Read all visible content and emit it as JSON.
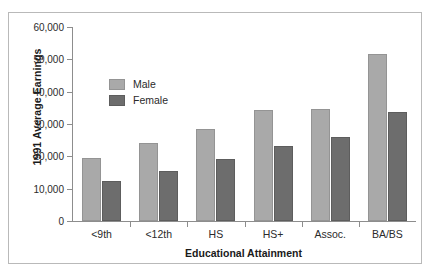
{
  "chart_data": {
    "type": "bar",
    "title": "",
    "xlabel": "Educational Attainment",
    "ylabel": "1991 Average Earnings",
    "categories": [
      "<9th",
      "<12th",
      "HS",
      "HS+",
      "Assoc.",
      "BA/BS"
    ],
    "series": [
      {
        "name": "Male",
        "color": "#a9a9a9",
        "values": [
          19500,
          24000,
          28500,
          34300,
          34700,
          51500
        ]
      },
      {
        "name": "Female",
        "color": "#6d6d6d",
        "values": [
          12500,
          15500,
          19300,
          23300,
          26000,
          33800
        ]
      }
    ],
    "ylim": [
      0,
      60000
    ],
    "ytick_values": [
      0,
      10000,
      20000,
      30000,
      40000,
      50000,
      60000
    ],
    "ytick_labels": [
      "0",
      "10,000",
      "20,000",
      "30,000",
      "40,000",
      "50,000",
      "60,000"
    ],
    "grid": false,
    "legend_position": "upper-left-inside"
  },
  "legend": {
    "items": [
      {
        "label": "Male"
      },
      {
        "label": "Female"
      }
    ]
  }
}
